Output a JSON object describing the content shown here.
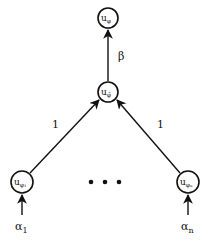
{
  "diagram": {
    "type": "directed-graph",
    "nodes": [
      {
        "id": "top",
        "label_main": "u",
        "label_sub": "φ",
        "cx": 108,
        "cy": 18
      },
      {
        "id": "mid",
        "label_main": "u",
        "label_sub": "φ̃",
        "cx": 108,
        "cy": 92
      },
      {
        "id": "left",
        "label_main": "u",
        "label_sub": "φ₁",
        "cx": 22,
        "cy": 182
      },
      {
        "id": "right",
        "label_main": "u",
        "label_sub": "φₙ",
        "cx": 188,
        "cy": 182
      }
    ],
    "edges": [
      {
        "from": "mid",
        "to": "top",
        "weight": "β"
      },
      {
        "from": "left",
        "to": "mid",
        "weight": "1"
      },
      {
        "from": "right",
        "to": "mid",
        "weight": "1"
      }
    ],
    "inputs": [
      {
        "to": "left",
        "label_main": "α",
        "label_sub": "1"
      },
      {
        "to": "right",
        "label_main": "α",
        "label_sub": "n"
      }
    ],
    "ellipsis": "• • •"
  }
}
